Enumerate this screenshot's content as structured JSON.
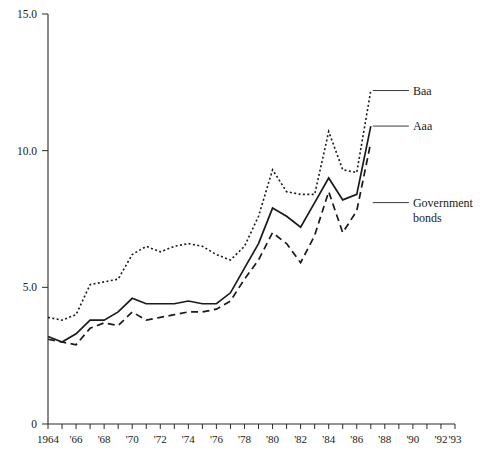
{
  "chart_data": {
    "type": "line",
    "title": "",
    "subtitle": "",
    "xlabel": "",
    "ylabel": "",
    "xlim": [
      1964,
      1993
    ],
    "ylim": [
      0,
      15
    ],
    "grid": false,
    "legend_position": "right-inline-annotations",
    "y_ticks": [
      "0",
      "5.0",
      "10.0",
      "15.0"
    ],
    "y_tick_values": [
      0,
      5,
      10,
      15
    ],
    "x_ticks": [
      "1964",
      "'66",
      "'68",
      "'70",
      "'72",
      "'74",
      "'76",
      "'78",
      "'80",
      "'82",
      "'84",
      "'86",
      "'88",
      "'90",
      "'92",
      "'93"
    ],
    "x_tick_values": [
      1964,
      1966,
      1968,
      1970,
      1972,
      1974,
      1976,
      1978,
      1980,
      1982,
      1984,
      1986,
      1988,
      1990,
      1992,
      1993
    ],
    "x_minor_ticks": [
      1964,
      1965,
      1966,
      1967,
      1968,
      1969,
      1970,
      1971,
      1972,
      1973,
      1974,
      1975,
      1976,
      1977,
      1978,
      1979,
      1980,
      1981,
      1982,
      1983,
      1984,
      1985,
      1986,
      1987,
      1988,
      1989,
      1990,
      1991,
      1992,
      1993
    ],
    "x": [
      1964,
      1965,
      1966,
      1967,
      1968,
      1969,
      1970,
      1971,
      1972,
      1973,
      1974,
      1975,
      1976,
      1977,
      1978,
      1979,
      1980,
      1981,
      1982,
      1983,
      1984,
      1985,
      1986,
      1987
    ],
    "series": [
      {
        "name": "Baa",
        "style": "dotted",
        "values": [
          3.9,
          3.8,
          4.0,
          5.1,
          5.2,
          5.3,
          6.2,
          6.5,
          6.3,
          6.5,
          6.6,
          6.5,
          6.2,
          6.0,
          6.5,
          7.6,
          9.3,
          8.5,
          8.4,
          8.4,
          10.7,
          9.3,
          9.2,
          12.2
        ]
      },
      {
        "name": "Aaa",
        "style": "solid",
        "values": [
          3.2,
          3.0,
          3.3,
          3.8,
          3.8,
          4.1,
          4.6,
          4.4,
          4.4,
          4.4,
          4.5,
          4.4,
          4.4,
          4.8,
          5.7,
          6.6,
          7.9,
          7.6,
          7.2,
          8.1,
          9.0,
          8.2,
          8.4,
          10.9
        ]
      },
      {
        "name": "Government bonds",
        "style": "dashed",
        "values": [
          3.1,
          3.0,
          2.9,
          3.5,
          3.7,
          3.6,
          4.1,
          3.8,
          3.9,
          4.0,
          4.1,
          4.1,
          4.2,
          4.5,
          5.3,
          6.0,
          7.0,
          6.6,
          5.9,
          6.9,
          8.5,
          7.0,
          7.8,
          10.3
        ]
      }
    ],
    "annotations": [
      {
        "label": "Baa",
        "attach_x": 1987,
        "attach_y": 12.2,
        "text_x": 1990,
        "text_y": 12.2
      },
      {
        "label": "Aaa",
        "attach_x": 1987,
        "attach_y": 10.9,
        "text_x": 1990,
        "text_y": 10.9
      },
      {
        "label": "Government",
        "label2": "bonds",
        "attach_x": 1987,
        "attach_y": 8.1,
        "text_x": 1990,
        "text_y": 8.1
      }
    ]
  },
  "annotation_labels": {
    "baa": "Baa",
    "aaa": "Aaa",
    "gov_line1": "Government",
    "gov_line2": "bonds"
  }
}
